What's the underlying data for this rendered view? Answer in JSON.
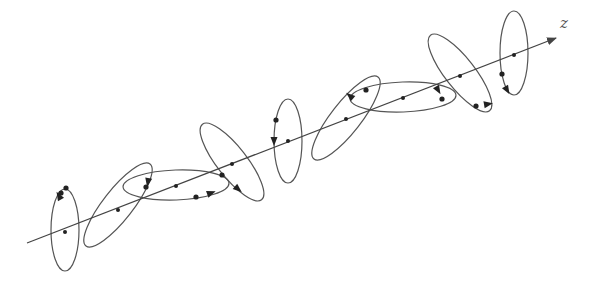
{
  "figure": {
    "type": "polarization-rotation-diagram",
    "axis": {
      "label": "z",
      "start": [
        27,
        243
      ],
      "end": [
        556,
        38
      ],
      "color": "#444444"
    },
    "stroke_color": "#555555",
    "dot_color": "#222222",
    "ellipses": [
      {
        "cx": 65,
        "cy": 230,
        "rx": 14,
        "ry": 41,
        "rot": 0,
        "dots": [
          [
            66,
            188
          ],
          [
            61,
            193
          ]
        ],
        "arrows": [
          [
            59,
            196,
            -120
          ]
        ]
      },
      {
        "cx": 118,
        "cy": 205,
        "rx": 52,
        "ry": 15,
        "rot": -52,
        "dots": [],
        "arrows": []
      },
      {
        "cx": 176,
        "cy": 185,
        "rx": 53,
        "ry": 15,
        "rot": -2,
        "dots": [
          [
            146,
            187
          ],
          [
            196,
            197
          ]
        ],
        "arrows": [
          [
            148,
            182,
            100
          ],
          [
            211,
            193,
            -20
          ]
        ]
      },
      {
        "cx": 232,
        "cy": 162,
        "rx": 48,
        "ry": 15,
        "rot": 52,
        "dots": [
          [
            222,
            175
          ]
        ],
        "arrows": [
          [
            238,
            189,
            40
          ]
        ]
      },
      {
        "cx": 288,
        "cy": 141,
        "rx": 14,
        "ry": 42,
        "rot": 0,
        "dots": [
          [
            276,
            120
          ]
        ],
        "arrows": [
          [
            274,
            141,
            90
          ]
        ]
      },
      {
        "cx": 346,
        "cy": 118,
        "rx": 52,
        "ry": 15,
        "rot": -52,
        "dots": [],
        "arrows": [
          [
            350,
            96,
            -140
          ]
        ]
      },
      {
        "cx": 403,
        "cy": 97,
        "rx": 53,
        "ry": 15,
        "rot": -2,
        "dots": [
          [
            366,
            90
          ],
          [
            442,
            99
          ]
        ],
        "arrows": [
          [
            438,
            90,
            60
          ]
        ]
      },
      {
        "cx": 460,
        "cy": 73,
        "rx": 48,
        "ry": 15,
        "rot": 52,
        "dots": [
          [
            476,
            106
          ]
        ],
        "arrows": [
          [
            488,
            104,
            -10
          ]
        ]
      },
      {
        "cx": 514,
        "cy": 53,
        "rx": 14,
        "ry": 42,
        "rot": 0,
        "dots": [
          [
            502,
            74
          ]
        ],
        "arrows": [
          [
            507,
            90,
            60
          ]
        ]
      }
    ],
    "axis_dots": [
      [
        65,
        232
      ],
      [
        118,
        210
      ],
      [
        176,
        186
      ],
      [
        232,
        164
      ],
      [
        288,
        141
      ],
      [
        346,
        119
      ],
      [
        403,
        98
      ],
      [
        460,
        76
      ],
      [
        514,
        55
      ]
    ]
  }
}
